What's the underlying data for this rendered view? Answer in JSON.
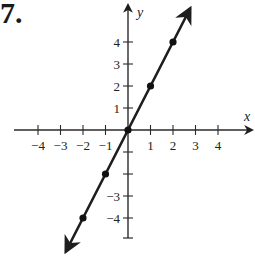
{
  "problem_number": "7.",
  "chart_data": {
    "type": "line",
    "title": "",
    "xlabel": "x",
    "ylabel": "y",
    "equation_implied": "y = 2x",
    "x": [
      -2,
      -1,
      0,
      1,
      2
    ],
    "series": [
      {
        "name": "line",
        "values": [
          -4,
          -2,
          0,
          2,
          4
        ],
        "arrows_both_ends": true
      }
    ],
    "points": [
      {
        "x": -2,
        "y": -4
      },
      {
        "x": -1,
        "y": -2
      },
      {
        "x": 0,
        "y": 0
      },
      {
        "x": 1,
        "y": 2
      },
      {
        "x": 2,
        "y": 4
      }
    ],
    "x_ticks": [
      -4,
      -3,
      -2,
      -1,
      1,
      2,
      3,
      4
    ],
    "x_tick_labels": [
      "−4",
      "−3",
      "−2",
      "−1",
      "1",
      "2",
      "3",
      "4"
    ],
    "y_ticks": [
      -4,
      -3,
      -2,
      -1,
      1,
      2,
      3,
      4
    ],
    "y_tick_labels_shown": [
      "4",
      "3",
      "2",
      "1",
      "−3",
      "−4"
    ],
    "xlim": [
      -4.5,
      5
    ],
    "ylim": [
      -5,
      5.5
    ],
    "grid": false,
    "legend": null
  },
  "colors": {
    "axis": "#2a2a2a",
    "line": "#1e1e1e",
    "point": "#111111"
  }
}
